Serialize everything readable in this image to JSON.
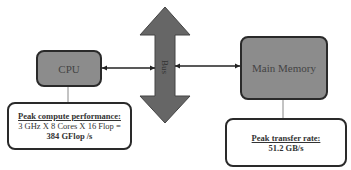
{
  "diagram": {
    "bus": {
      "label": "Bus",
      "color": "#666666"
    },
    "cpu": {
      "label": "CPU",
      "color": "#8c8c8c"
    },
    "memory": {
      "label": "Main Memory",
      "color": "#8c8c8c"
    },
    "cpu_note": {
      "heading": "Peak compute performance:",
      "line1": "3 GHz X 8 Cores X 16 Flop =",
      "line2": "384 GFlop /s"
    },
    "memory_note": {
      "heading": "Peak transfer rate:",
      "line1": "51.2 GB/s"
    }
  }
}
